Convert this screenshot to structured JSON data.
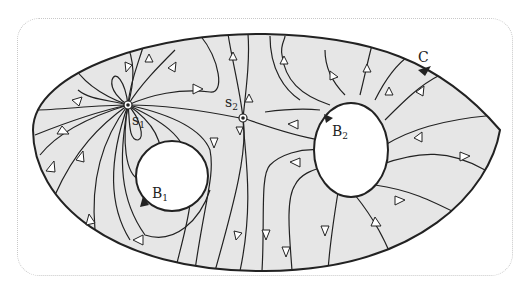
{
  "diagram": {
    "type": "streamline-field",
    "colors": {
      "region_fill": "#e6e6e6",
      "stroke": "#222222",
      "hole_fill": "#ffffff",
      "arrow_fill": "#ffffff"
    },
    "labels": {
      "outer_boundary": "C",
      "hole1": "B",
      "hole1_sub": "1",
      "hole2": "B",
      "hole2_sub": "2",
      "singular1": "s",
      "singular1_sub": "1",
      "singular2": "s",
      "singular2_sub": "2"
    }
  }
}
